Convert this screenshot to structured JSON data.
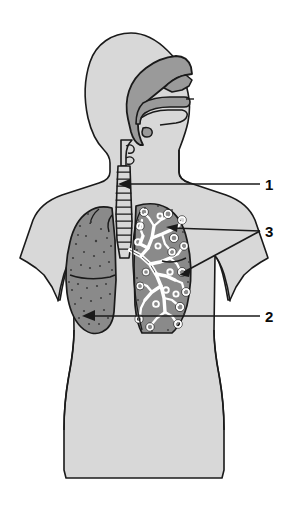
{
  "figure": {
    "background_color": "#ffffff",
    "width": 288,
    "height": 511
  },
  "colors": {
    "body_silhouette": "#d8d8d8",
    "airway_upper": "#9a9a9a",
    "lung_solid": "#8a8a8a",
    "lung_cutaway": "#8a8a8a",
    "bronchial_tree": "#ffffff",
    "outline": "#1a1a1a",
    "label_text": "#0a0a0a",
    "leader_line": "#1a1a1a"
  },
  "anatomy": {
    "parts": [
      {
        "name": "head-profile",
        "fill": "#d8d8d8"
      },
      {
        "name": "nasal-cavity",
        "fill": "#9a9a9a"
      },
      {
        "name": "oral-cavity-tongue",
        "fill": "#9a9a9a"
      },
      {
        "name": "pharynx",
        "fill": "#9a9a9a"
      },
      {
        "name": "larynx",
        "fill": "#d8d8d8"
      },
      {
        "name": "trachea",
        "fill": "#d8d8d8"
      },
      {
        "name": "left-lung-intact",
        "fill": "#8a8a8a"
      },
      {
        "name": "right-lung-cutaway",
        "fill": "#8a8a8a"
      },
      {
        "name": "bronchial-tree",
        "fill": "#ffffff"
      },
      {
        "name": "torso-silhouette",
        "fill": "#d8d8d8"
      }
    ]
  },
  "labels": [
    {
      "id": "label-1",
      "text": "1",
      "target": "trachea",
      "leader_style": "arrow",
      "leader_from": {
        "x": 262,
        "y": 184
      },
      "leader_to": {
        "x": 119,
        "y": 184
      }
    },
    {
      "id": "label-3",
      "text": "3",
      "target": "bronchi-and-bronchioles",
      "leader_style": "two-branch",
      "leader_from": {
        "x": 262,
        "y": 231
      },
      "leader_to": [
        {
          "x": 175,
          "y": 228
        },
        {
          "x": 186,
          "y": 271
        }
      ]
    },
    {
      "id": "label-2",
      "text": "2",
      "target": "lung",
      "leader_style": "arrow",
      "leader_from": {
        "x": 262,
        "y": 316
      },
      "leader_to": {
        "x": 83,
        "y": 316
      }
    }
  ]
}
